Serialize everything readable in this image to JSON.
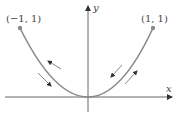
{
  "diagram": {
    "type": "parametric-curve",
    "curve": "parabola y = x^2 from x = -1 to x = 1",
    "axes": {
      "x_label": "x",
      "y_label": "y"
    },
    "points": [
      {
        "label": "(−1, 1)",
        "x": -1,
        "y": 1
      },
      {
        "label": "(1, 1)",
        "x": 1,
        "y": 1
      }
    ],
    "direction_arrows": [
      {
        "side": "left",
        "position": "outer",
        "direction": "up-left"
      },
      {
        "side": "left",
        "position": "inner",
        "direction": "down-right"
      },
      {
        "side": "right",
        "position": "outer",
        "direction": "down-left"
      },
      {
        "side": "right",
        "position": "inner",
        "direction": "up-right"
      }
    ],
    "colors": {
      "curve": "#8a8a8a",
      "axes": "#555555",
      "arrows": "#666666",
      "text": "#444444"
    }
  }
}
